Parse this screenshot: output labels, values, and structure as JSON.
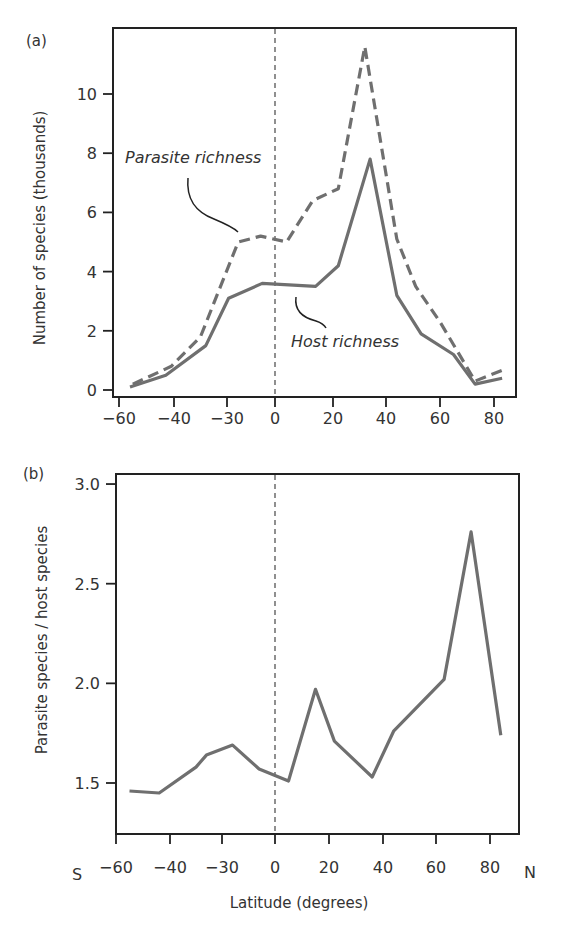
{
  "chart_data": [
    {
      "panel": "(a)",
      "type": "line",
      "title": "",
      "xlabel": "",
      "ylabel": "Number of species (thousands)",
      "x_ticks": [
        -60,
        -40,
        -30,
        0,
        20,
        40,
        60,
        80
      ],
      "x_tick_labels": [
        "−60",
        "−40",
        "−30",
        "0",
        "20",
        "40",
        "60",
        "80"
      ],
      "y_ticks": [
        0,
        2,
        4,
        6,
        8,
        10
      ],
      "y_tick_labels": [
        "0",
        "2",
        "4",
        "6",
        "8",
        "10"
      ],
      "ylim": [
        0,
        12
      ],
      "grid": false,
      "reference_line": {
        "x": 0,
        "style": "dashed"
      },
      "series": [
        {
          "name": "Parasite richness",
          "style": "dashed",
          "x": [
            -55,
            -41,
            -35,
            -23,
            -9,
            4,
            13,
            22,
            32,
            44,
            51,
            60,
            73,
            84
          ],
          "values": [
            0.2,
            0.8,
            1.8,
            5.0,
            5.2,
            5.0,
            6.4,
            6.8,
            11.6,
            5.1,
            3.5,
            2.3,
            0.3,
            0.7
          ]
        },
        {
          "name": "Host richness",
          "style": "solid",
          "x": [
            -56,
            -43,
            -34,
            -29,
            -8,
            14,
            22,
            34,
            44,
            53,
            65,
            73,
            83
          ],
          "values": [
            0.1,
            0.5,
            1.5,
            3.1,
            3.6,
            3.5,
            4.2,
            7.8,
            3.2,
            1.9,
            1.2,
            0.2,
            0.4
          ]
        }
      ],
      "annotations": [
        {
          "text": "Parasite richness",
          "target": "Parasite richness"
        },
        {
          "text": "Host richness",
          "target": "Host richness"
        }
      ]
    },
    {
      "panel": "(b)",
      "type": "line",
      "title": "",
      "xlabel": "Latitude (degrees)",
      "ylabel": "Parasite species / host species",
      "x_ticks": [
        -60,
        -40,
        -30,
        0,
        20,
        40,
        60,
        80
      ],
      "x_tick_labels": [
        "−60",
        "−40",
        "−30",
        "0",
        "20",
        "40",
        "60",
        "80"
      ],
      "x_end_labels": {
        "left": "S",
        "right": "N"
      },
      "y_ticks": [
        1.5,
        2.0,
        2.5,
        3.0
      ],
      "y_tick_labels": [
        "1.5",
        "2.0",
        "2.5",
        "3.0"
      ],
      "ylim": [
        1.24,
        3.05
      ],
      "grid": false,
      "reference_line": {
        "x": 0,
        "style": "dashed"
      },
      "series": [
        {
          "name": "Parasite species / host species",
          "style": "solid",
          "x": [
            -55,
            -44,
            -35,
            -33,
            -24,
            -9,
            5,
            15,
            22,
            36,
            44,
            63,
            73,
            84
          ],
          "values": [
            1.46,
            1.45,
            1.58,
            1.64,
            1.69,
            1.57,
            1.51,
            1.97,
            1.71,
            1.53,
            1.76,
            2.02,
            2.76,
            1.74
          ]
        }
      ]
    }
  ],
  "labels": {
    "panel_a": "(a)",
    "panel_b": "(b)",
    "ylabel_a": "Number of species (thousands)",
    "ylabel_b": "Parasite species / host species",
    "xlabel": "Latitude (degrees)",
    "south": "S",
    "north": "N",
    "annot_parasite": "Parasite richness",
    "annot_host": "Host richness"
  },
  "colors": {
    "series_line": "#6f6f6f",
    "axis": "#222222",
    "text": "#333333"
  }
}
